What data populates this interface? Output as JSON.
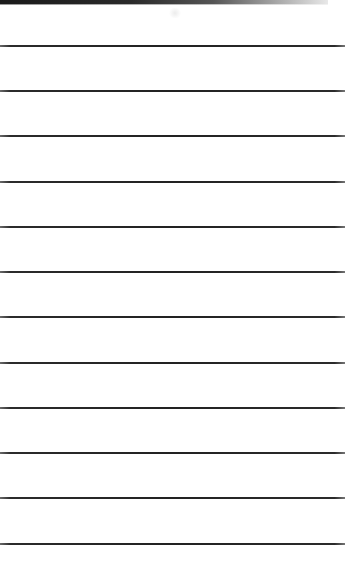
{
  "page": {
    "type": "lined-paper",
    "background_color": "#ffffff",
    "line_color": "#222222",
    "top_edge_color": "#1a1a1a"
  },
  "lines": [
    {
      "y": 45
    },
    {
      "y": 90
    },
    {
      "y": 135
    },
    {
      "y": 181
    },
    {
      "y": 226
    },
    {
      "y": 271
    },
    {
      "y": 316
    },
    {
      "y": 362
    },
    {
      "y": 407
    },
    {
      "y": 452
    },
    {
      "y": 497
    },
    {
      "y": 543
    }
  ]
}
